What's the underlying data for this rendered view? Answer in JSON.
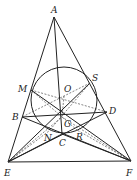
{
  "diagram": {
    "type": "geometry-figure",
    "points": {
      "A": [
        54,
        17
      ],
      "M": [
        31,
        90
      ],
      "S": [
        90,
        83
      ],
      "O": [
        64,
        96
      ],
      "B": [
        22,
        117
      ],
      "D": [
        107,
        112
      ],
      "G": [
        62,
        117
      ],
      "C": [
        62,
        134
      ],
      "N": [
        49,
        131
      ],
      "R": [
        77,
        130
      ],
      "E": [
        8,
        162
      ],
      "F": [
        131,
        161
      ]
    },
    "labels": [
      {
        "text": "A",
        "x": 51,
        "y": 13
      },
      {
        "text": "M",
        "x": 18,
        "y": 92
      },
      {
        "text": "S",
        "x": 92,
        "y": 81
      },
      {
        "text": "O",
        "x": 64,
        "y": 92
      },
      {
        "text": "B",
        "x": 12,
        "y": 120
      },
      {
        "text": "D",
        "x": 109,
        "y": 114
      },
      {
        "text": "G",
        "x": 64,
        "y": 127
      },
      {
        "text": "N",
        "x": 44,
        "y": 141
      },
      {
        "text": "C",
        "x": 59,
        "y": 146
      },
      {
        "text": "R",
        "x": 76,
        "y": 140
      },
      {
        "text": "E",
        "x": 4,
        "y": 176
      },
      {
        "text": "F",
        "x": 126,
        "y": 176
      }
    ],
    "circle": {
      "cx": 64,
      "cy": 100,
      "r": 33
    }
  }
}
